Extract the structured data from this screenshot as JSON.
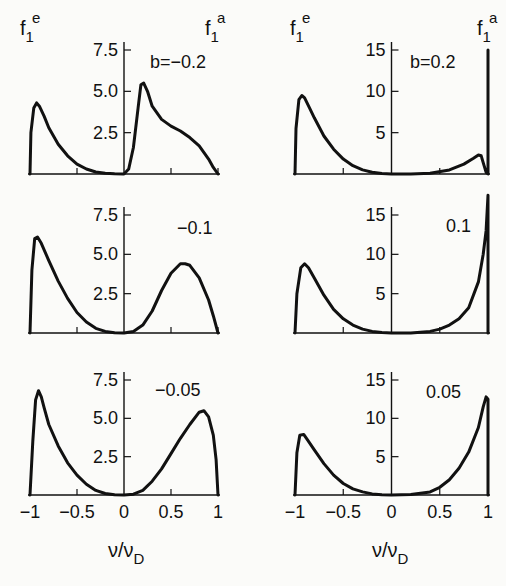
{
  "figure": {
    "xlabel": "ν/ν",
    "xlabel_sub": "D",
    "ylabel_left": {
      "base": "f",
      "sub": "1",
      "sup": "e"
    },
    "ylabel_right": {
      "base": "f",
      "sub": "1",
      "sup": "a"
    }
  },
  "chart_data": [
    {
      "type": "line",
      "panel": "left-top",
      "annotation": "b=−0.2",
      "xlabel": "ν/ν_D",
      "xlim": [
        -1,
        1
      ],
      "ylim": [
        0,
        7.5
      ],
      "xticks": [
        -1,
        -0.5,
        0,
        0.5,
        1
      ],
      "yticks": [
        2.5,
        5.0,
        7.5
      ],
      "ytick_labels": [
        "2.5",
        "5.0",
        "7.5"
      ],
      "x": [
        -1,
        -0.99,
        -0.96,
        -0.93,
        -0.9,
        -0.85,
        -0.8,
        -0.7,
        -0.6,
        -0.5,
        -0.4,
        -0.3,
        -0.2,
        -0.1,
        0,
        0.05,
        0.1,
        0.15,
        0.18,
        0.21,
        0.25,
        0.3,
        0.4,
        0.5,
        0.6,
        0.7,
        0.8,
        0.9,
        0.95,
        1
      ],
      "y": [
        0,
        2.5,
        4.0,
        4.3,
        4.1,
        3.5,
        2.8,
        1.8,
        1.1,
        0.6,
        0.3,
        0.12,
        0.04,
        0.01,
        0,
        0.3,
        1.6,
        4.0,
        5.4,
        5.5,
        5.0,
        4.1,
        3.3,
        2.9,
        2.6,
        2.2,
        1.7,
        0.9,
        0.4,
        0
      ]
    },
    {
      "type": "line",
      "panel": "right-top",
      "annotation": "b=0.2",
      "xlabel": "ν/ν_D",
      "xlim": [
        -1,
        1
      ],
      "ylim": [
        0,
        15
      ],
      "xticks": [
        -1,
        -0.5,
        0,
        0.5,
        1
      ],
      "yticks": [
        5,
        10,
        15
      ],
      "ytick_labels": [
        "5",
        "10",
        "15"
      ],
      "x": [
        -1,
        -0.99,
        -0.96,
        -0.93,
        -0.9,
        -0.85,
        -0.8,
        -0.7,
        -0.6,
        -0.5,
        -0.4,
        -0.3,
        -0.2,
        -0.1,
        0,
        0.2,
        0.4,
        0.6,
        0.75,
        0.85,
        0.9,
        0.93,
        0.96,
        0.98,
        1,
        1,
        1
      ],
      "y": [
        0,
        5.5,
        9.0,
        9.5,
        9.2,
        8.0,
        6.8,
        4.6,
        3.0,
        1.8,
        1.0,
        0.5,
        0.2,
        0.05,
        0,
        -0.1,
        0.1,
        0.5,
        1.2,
        1.9,
        2.3,
        2.2,
        1.0,
        0.2,
        0,
        0,
        15.0
      ]
    },
    {
      "type": "line",
      "panel": "left-middle",
      "annotation": "−0.1",
      "xlabel": "ν/ν_D",
      "xlim": [
        -1,
        1
      ],
      "ylim": [
        0,
        7.5
      ],
      "xticks": [
        -1,
        -0.5,
        0,
        0.5,
        1
      ],
      "yticks": [
        2.5,
        5.0,
        7.5
      ],
      "ytick_labels": [
        "2.5",
        "5.0",
        "7.5"
      ],
      "x": [
        -1,
        -0.98,
        -0.95,
        -0.92,
        -0.88,
        -0.8,
        -0.7,
        -0.6,
        -0.5,
        -0.4,
        -0.3,
        -0.2,
        -0.1,
        0,
        0.1,
        0.2,
        0.3,
        0.4,
        0.5,
        0.6,
        0.65,
        0.7,
        0.8,
        0.9,
        0.95,
        1
      ],
      "y": [
        0,
        4.0,
        6.0,
        6.1,
        5.7,
        4.6,
        3.3,
        2.2,
        1.3,
        0.7,
        0.3,
        0.1,
        0.02,
        0,
        0.1,
        0.5,
        1.4,
        2.7,
        3.8,
        4.4,
        4.4,
        4.3,
        3.5,
        2.1,
        1.1,
        0
      ]
    },
    {
      "type": "line",
      "panel": "right-middle",
      "annotation": "0.1",
      "xlabel": "ν/ν_D",
      "xlim": [
        -1,
        1
      ],
      "ylim": [
        0,
        15
      ],
      "xticks": [
        -1,
        -0.5,
        0,
        0.5,
        1
      ],
      "yticks": [
        5,
        10,
        15
      ],
      "ytick_labels": [
        "5",
        "10",
        "15"
      ],
      "x": [
        -1,
        -0.98,
        -0.94,
        -0.9,
        -0.86,
        -0.8,
        -0.7,
        -0.6,
        -0.5,
        -0.4,
        -0.3,
        -0.2,
        -0.1,
        0,
        0.2,
        0.4,
        0.5,
        0.6,
        0.7,
        0.8,
        0.9,
        0.95,
        0.98,
        1,
        1
      ],
      "y": [
        0,
        5.0,
        8.3,
        8.8,
        8.3,
        7.0,
        4.8,
        3.0,
        1.8,
        1.0,
        0.5,
        0.2,
        0.05,
        0,
        0,
        0.2,
        0.5,
        1.0,
        1.8,
        3.2,
        6.5,
        10.0,
        13.0,
        17.5,
        0
      ]
    },
    {
      "type": "line",
      "panel": "left-bottom",
      "annotation": "−0.05",
      "xlabel": "ν/ν_D",
      "xlim": [
        -1,
        1
      ],
      "ylim": [
        0,
        7.5
      ],
      "xticks": [
        -1,
        -0.5,
        0,
        0.5,
        1
      ],
      "xtick_labels": [
        "−1",
        "−0.5",
        "0",
        "0.5",
        "1"
      ],
      "yticks": [
        2.5,
        5.0,
        7.5
      ],
      "ytick_labels": [
        "2.5",
        "5.0",
        "7.5"
      ],
      "x": [
        -1,
        -0.97,
        -0.94,
        -0.91,
        -0.88,
        -0.85,
        -0.8,
        -0.7,
        -0.6,
        -0.5,
        -0.4,
        -0.3,
        -0.2,
        -0.1,
        0,
        0.1,
        0.2,
        0.3,
        0.4,
        0.5,
        0.6,
        0.7,
        0.8,
        0.85,
        0.9,
        0.95,
        0.98,
        1
      ],
      "y": [
        0,
        3.5,
        6.2,
        6.8,
        6.4,
        5.7,
        4.6,
        3.2,
        2.1,
        1.3,
        0.7,
        0.3,
        0.1,
        0.02,
        0,
        0.05,
        0.3,
        0.9,
        1.7,
        2.7,
        3.7,
        4.6,
        5.4,
        5.5,
        5.1,
        3.9,
        2.3,
        0
      ]
    },
    {
      "type": "line",
      "panel": "right-bottom",
      "annotation": "0.05",
      "xlabel": "ν/ν_D",
      "xlim": [
        -1,
        1
      ],
      "ylim": [
        0,
        15
      ],
      "xticks": [
        -1,
        -0.5,
        0,
        0.5,
        1
      ],
      "xtick_labels": [
        "−1",
        "−0.5",
        "0",
        "0.5",
        "1"
      ],
      "yticks": [
        5,
        10,
        15
      ],
      "ytick_labels": [
        "5",
        "10",
        "15"
      ],
      "x": [
        -1,
        -0.98,
        -0.95,
        -0.91,
        -0.87,
        -0.8,
        -0.7,
        -0.6,
        -0.5,
        -0.4,
        -0.3,
        -0.2,
        -0.1,
        0,
        0.2,
        0.4,
        0.5,
        0.6,
        0.7,
        0.8,
        0.9,
        0.95,
        0.98,
        1,
        1
      ],
      "y": [
        0,
        5.5,
        7.8,
        7.9,
        7.2,
        5.9,
        4.1,
        2.6,
        1.5,
        0.8,
        0.4,
        0.15,
        0.04,
        0,
        0.05,
        0.4,
        1.0,
        2.0,
        3.5,
        5.6,
        8.8,
        11.5,
        12.8,
        12.5,
        0
      ]
    }
  ],
  "layout": {
    "panels": [
      {
        "x0": 30,
        "x1": 218,
        "y0": 174,
        "ytop": 50,
        "ytopval": 7.5
      },
      {
        "x0": 295,
        "x1": 488,
        "y0": 174,
        "ytop": 50,
        "ytopval": 15
      },
      {
        "x0": 30,
        "x1": 218,
        "y0": 333,
        "ytop": 215,
        "ytopval": 7.5
      },
      {
        "x0": 295,
        "x1": 488,
        "y0": 333,
        "ytop": 215,
        "ytopval": 15
      },
      {
        "x0": 30,
        "x1": 218,
        "y0": 495,
        "ytop": 380,
        "ytopval": 7.5
      },
      {
        "x0": 295,
        "x1": 488,
        "y0": 495,
        "ytop": 380,
        "ytopval": 15
      }
    ],
    "annotations": [
      {
        "x": 150,
        "y": 62
      },
      {
        "x": 410,
        "y": 62
      },
      {
        "x": 177,
        "y": 228
      },
      {
        "x": 446,
        "y": 226
      },
      {
        "x": 155,
        "y": 390
      },
      {
        "x": 426,
        "y": 392
      }
    ]
  }
}
